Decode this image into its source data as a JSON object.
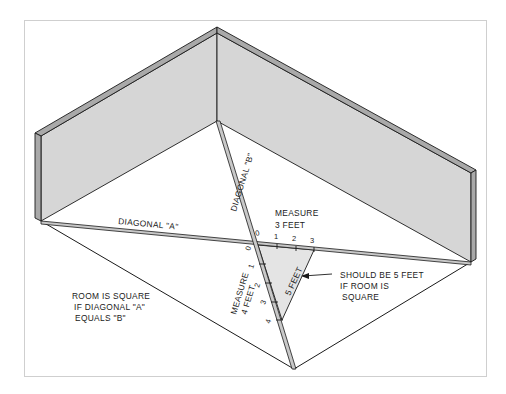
{
  "diagram": {
    "colors": {
      "wall_fill": "#d6d6d6",
      "wall_edge": "#a9a9a9",
      "triangle_fill": "#e4e4e4",
      "line": "#1a1a1a",
      "frame": "#cfcfcf"
    },
    "labels": {
      "diagonal_a": "DIAGONAL \"A\"",
      "diagonal_b": "DIAGONAL \"B\"",
      "measure_3_line1": "MEASURE",
      "measure_3_line2": "3 FEET",
      "measure_4_line1": "MEASURE",
      "measure_4_line2": "4 FEET",
      "hypotenuse": "5 FEET",
      "callout_line1": "SHOULD BE 5 FEET",
      "callout_line2": "IF ROOM IS",
      "callout_line3": "SQUARE",
      "note_line1": "ROOM IS SQUARE",
      "note_line2": "IF DIAGONAL \"A\"",
      "note_line3": "EQUALS \"B\""
    },
    "scale_3ft": [
      "0",
      "1",
      "2",
      "3"
    ],
    "scale_4ft": [
      "0",
      "1",
      "2",
      "3",
      "4"
    ]
  }
}
